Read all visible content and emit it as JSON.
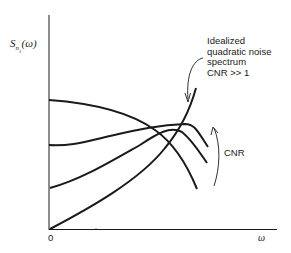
{
  "diagram": {
    "y_axis_label": {
      "symbol": "S",
      "subscript": "n",
      "subsub": "1",
      "arg": "(ω)"
    },
    "x_axis_label": "ω",
    "origin_label": "0",
    "annotation": {
      "line1": "Idealized",
      "line2": "quadratic noise",
      "line3": "spectrum",
      "line4": "CNR >> 1"
    },
    "cnr_arrow_label": "CNR",
    "curves": [
      {
        "name": "low-CNR curve",
        "description": "starts high, decreases"
      },
      {
        "name": "mid-CNR curve 1",
        "description": "flat then rising peak"
      },
      {
        "name": "mid-CNR curve 2",
        "description": "rising then peak"
      },
      {
        "name": "idealized quadratic",
        "description": "starts at zero, rises quadratically"
      }
    ],
    "stroke_color": "#1a1a1a"
  }
}
